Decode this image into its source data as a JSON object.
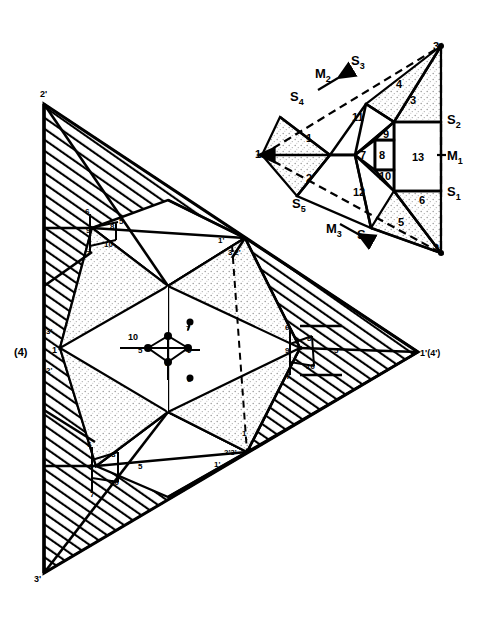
{
  "figure": {
    "title": "",
    "colors": {
      "line": "#000000",
      "background": "#ffffff",
      "hatch": "#000000",
      "stipple": "#bdbdbd"
    }
  },
  "inset": {
    "name": "fundamental-domain-triangle",
    "vertices": [
      {
        "id": "v1",
        "label": "1",
        "x": 262,
        "y": 155
      },
      {
        "id": "v2",
        "label": "2",
        "x": 441,
        "y": 253
      },
      {
        "id": "v3",
        "label": "3",
        "x": 441,
        "y": 46
      }
    ],
    "mirror_labels": [
      {
        "id": "M1",
        "base": "M",
        "sub": "1",
        "x": 451,
        "y": 155
      },
      {
        "id": "M2",
        "base": "M",
        "sub": "2",
        "x": 322,
        "y": 73
      },
      {
        "id": "M3",
        "base": "M",
        "sub": "3",
        "x": 333,
        "y": 228
      }
    ],
    "sigma_labels": [
      {
        "id": "S1",
        "base": "S",
        "sub": "1",
        "x": 451,
        "y": 191
      },
      {
        "id": "S2",
        "base": "S",
        "sub": "2",
        "x": 451,
        "y": 119
      },
      {
        "id": "S3",
        "base": "S",
        "sub": "3",
        "x": 357,
        "y": 60
      },
      {
        "id": "S4",
        "base": "S",
        "sub": "4",
        "x": 296,
        "y": 96
      },
      {
        "id": "S5",
        "base": "S",
        "sub": "5",
        "x": 298,
        "y": 203
      },
      {
        "id": "S6",
        "base": "S",
        "sub": "6",
        "x": 363,
        "y": 234
      }
    ],
    "regions": [
      {
        "id": "r1",
        "label": "1",
        "x": 310,
        "y": 138,
        "fill": "stipple"
      },
      {
        "id": "r2",
        "label": "2",
        "x": 310,
        "y": 178,
        "fill": "stipple"
      },
      {
        "id": "r3",
        "label": "3",
        "x": 411,
        "y": 100,
        "fill": "stipple"
      },
      {
        "id": "r4",
        "label": "4",
        "x": 399,
        "y": 84,
        "fill": "stipple"
      },
      {
        "id": "r5",
        "label": "5",
        "x": 400,
        "y": 222,
        "fill": "stipple"
      },
      {
        "id": "r6",
        "label": "6",
        "x": 422,
        "y": 200,
        "fill": "stipple"
      },
      {
        "id": "r7",
        "label": "7",
        "x": 364,
        "y": 155,
        "fill": "white"
      },
      {
        "id": "r8",
        "label": "8",
        "x": 382,
        "y": 155,
        "fill": "white"
      },
      {
        "id": "r9",
        "label": "9",
        "x": 387,
        "y": 138,
        "fill": "white"
      },
      {
        "id": "r10",
        "label": "10",
        "x": 388,
        "y": 172,
        "fill": "white"
      },
      {
        "id": "r11",
        "label": "11",
        "x": 359,
        "y": 117,
        "fill": "white"
      },
      {
        "id": "r12",
        "label": "12",
        "x": 360,
        "y": 192,
        "fill": "white"
      },
      {
        "id": "r13",
        "label": "13",
        "x": 418,
        "y": 157,
        "fill": "white"
      }
    ]
  },
  "main": {
    "name": "large-hatched-triangle",
    "vertex_labels": [
      {
        "id": "top",
        "label": "2'",
        "x": 40,
        "y": 97
      },
      {
        "id": "bottom",
        "label": "3'",
        "x": 34,
        "y": 576
      },
      {
        "id": "left-paren",
        "label": "(4)",
        "x": 18,
        "y": 352
      },
      {
        "id": "left-1",
        "label": "1",
        "x": 53,
        "y": 350
      },
      {
        "id": "left-3",
        "label": "3'",
        "x": 45,
        "y": 331
      },
      {
        "id": "left-2",
        "label": "2'",
        "x": 45,
        "y": 370
      },
      {
        "id": "right",
        "label": "1'(4')",
        "x": 418,
        "y": 352
      }
    ],
    "inner_labels": [
      {
        "id": "m1",
        "label": "1'",
        "x": 222,
        "y": 240
      },
      {
        "id": "m2",
        "label": "3'2'",
        "x": 233,
        "y": 251
      },
      {
        "id": "m3",
        "label": "2'3'",
        "x": 228,
        "y": 452
      },
      {
        "id": "m4",
        "label": "1'",
        "x": 219,
        "y": 464
      },
      {
        "id": "m5",
        "label": "10",
        "x": 134,
        "y": 336
      },
      {
        "id": "m6",
        "label": "1",
        "x": 244,
        "y": 432
      }
    ],
    "hub_clusters": [
      {
        "id": "cluster-top",
        "center": {
          "x": 91,
          "y": 228
        },
        "nodes": [
          {
            "label": "6",
            "x": 88,
            "y": 210
          },
          {
            "label": "5",
            "x": 122,
            "y": 220
          },
          {
            "label": "8",
            "x": 113,
            "y": 226
          },
          {
            "label": "9",
            "x": 89,
            "y": 230
          },
          {
            "label": "10",
            "x": 110,
            "y": 243
          },
          {
            "label": "7",
            "x": 89,
            "y": 252
          }
        ]
      },
      {
        "id": "cluster-bottom",
        "center": {
          "x": 95,
          "y": 466
        },
        "nodes": [
          {
            "label": "6",
            "x": 90,
            "y": 443
          },
          {
            "label": "8",
            "x": 114,
            "y": 454
          },
          {
            "label": "9",
            "x": 92,
            "y": 466
          },
          {
            "label": "5",
            "x": 141,
            "y": 466
          },
          {
            "label": "10",
            "x": 116,
            "y": 481
          },
          {
            "label": "7",
            "x": 93,
            "y": 493
          }
        ]
      },
      {
        "id": "cluster-right",
        "center": {
          "x": 300,
          "y": 348
        },
        "nodes": [
          {
            "label": "6",
            "x": 288,
            "y": 326
          },
          {
            "label": "8",
            "x": 310,
            "y": 338
          },
          {
            "label": "9",
            "x": 288,
            "y": 350
          },
          {
            "label": "5",
            "x": 337,
            "y": 350
          },
          {
            "label": "10",
            "x": 312,
            "y": 365
          },
          {
            "label": "7",
            "x": 289,
            "y": 375
          }
        ]
      },
      {
        "id": "cluster-center",
        "center": {
          "x": 168,
          "y": 348
        },
        "nodes": [
          {
            "label": "10",
            "x": 142,
            "y": 336
          },
          {
            "label": "5",
            "x": 142,
            "y": 350
          },
          {
            "label": "7",
            "x": 189,
            "y": 328
          },
          {
            "label": "9",
            "x": 190,
            "y": 350
          },
          {
            "label": "8",
            "x": 165,
            "y": 362
          },
          {
            "label": "6",
            "x": 190,
            "y": 378
          }
        ]
      }
    ]
  }
}
